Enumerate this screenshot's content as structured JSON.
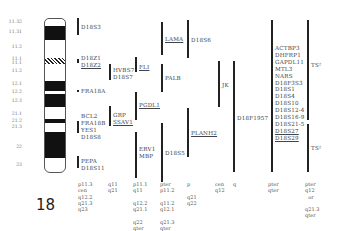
{
  "chromosome": {
    "number": "18",
    "band_labels": [
      {
        "text": "11.32",
        "y": 19
      },
      {
        "text": "11.31",
        "y": 29
      },
      {
        "text": "11.2",
        "y": 44
      },
      {
        "text": "11.1",
        "y": 56
      },
      {
        "text": "11.1",
        "y": 60
      },
      {
        "text": "11.2",
        "y": 68
      },
      {
        "text": "12.1",
        "y": 81
      },
      {
        "text": "12.2",
        "y": 89
      },
      {
        "text": "12.3",
        "y": 98
      },
      {
        "text": "21.1",
        "y": 111
      },
      {
        "text": "21.2",
        "y": 118
      },
      {
        "text": "21.3",
        "y": 124
      },
      {
        "text": "22",
        "y": 144
      },
      {
        "text": "23",
        "y": 162
      }
    ]
  },
  "columns": [
    {
      "id": "col1",
      "groups": [
        {
          "bar": [
            77,
            18,
            17
          ],
          "labels": [
            "D18S3"
          ],
          "underline": [
            false
          ],
          "label_x": 81,
          "label_y": 24
        },
        {
          "bar": [
            77,
            59,
            4
          ],
          "labels": [
            "D18Z1",
            "D18Z2"
          ],
          "underline": [
            false,
            true
          ],
          "label_x": 81,
          "label_y": 55
        },
        {
          "dot": [
            77,
            90
          ],
          "labels": [
            "FRA18A"
          ],
          "underline": [
            false
          ],
          "label_x": 81,
          "label_y": 88
        },
        {
          "bar": [
            77,
            121,
            12
          ],
          "labels": [
            "BCL2",
            "FRA18B",
            "YES1",
            "D18S8"
          ],
          "underline": [
            false,
            false,
            false,
            false
          ],
          "label_x": 81,
          "label_y": 113
        },
        {
          "bar": [
            77,
            156,
            12
          ],
          "labels": [
            "PEPA",
            "D18S11"
          ],
          "underline": [
            false,
            false
          ],
          "label_x": 81,
          "label_y": 158
        }
      ],
      "positions": {
        "x": 78,
        "y": 181,
        "lines": [
          "p11.3",
          "cen",
          "q12.2",
          "q21.3",
          "q23"
        ]
      }
    },
    {
      "id": "col2",
      "groups": [
        {
          "bar": [
            109,
            64,
            16
          ],
          "labels": [
            "HVBS7",
            "D18S7"
          ],
          "underline": [
            false,
            false
          ],
          "label_x": 113,
          "label_y": 67
        },
        {
          "bar": [
            109,
            106,
            20
          ],
          "labels": [
            "GRP",
            "SSAV1"
          ],
          "underline": [
            false,
            true
          ],
          "label_x": 113,
          "label_y": 112
        }
      ],
      "positions": {
        "x": 108,
        "y": 181,
        "lines": [
          "q11",
          "q21"
        ]
      }
    },
    {
      "id": "col3",
      "groups": [
        {
          "bar": [
            135,
            57,
            15
          ],
          "labels": [
            "FLI"
          ],
          "underline": [
            true
          ],
          "label_x": 139,
          "label_y": 64
        },
        {
          "bar": [
            135,
            92,
            28
          ],
          "labels": [
            "PGDL1"
          ],
          "underline": [
            true
          ],
          "label_x": 139,
          "label_y": 102
        },
        {
          "bar": [
            135,
            132,
            46
          ],
          "labels": [
            "ERV1",
            "MBP"
          ],
          "underline": [
            false,
            false
          ],
          "label_x": 139,
          "label_y": 146
        }
      ],
      "positions": {
        "x": 133,
        "y": 181,
        "lines": [
          "p11.1",
          "q11",
          "",
          "q12.2",
          "q21.1",
          "",
          "q22",
          "qter"
        ]
      }
    },
    {
      "id": "col4",
      "groups": [
        {
          "bar": [
            161,
            22,
            33
          ],
          "labels": [
            "LAMA"
          ],
          "underline": [
            true
          ],
          "label_x": 165,
          "label_y": 36
        },
        {
          "bar": [
            161,
            64,
            28
          ],
          "labels": [
            "PALB"
          ],
          "underline": [
            false
          ],
          "label_x": 165,
          "label_y": 75
        },
        {
          "bar": [
            161,
            123,
            59
          ],
          "labels": [
            "D18S5"
          ],
          "underline": [
            false
          ],
          "label_x": 165,
          "label_y": 150
        }
      ],
      "positions": {
        "x": 160,
        "y": 181,
        "lines": [
          "pter",
          "p11.2",
          "",
          "q11.2",
          "q12.1",
          "",
          "q21.3",
          "qter"
        ]
      }
    },
    {
      "id": "col5",
      "groups": [
        {
          "bar": [
            187,
            20,
            38
          ],
          "labels": [
            "D18S6"
          ],
          "underline": [
            false
          ],
          "label_x": 191,
          "label_y": 37
        },
        {
          "bar": [
            187,
            108,
            49
          ],
          "labels": [
            "PLANH2"
          ],
          "underline": [
            true
          ],
          "label_x": 191,
          "label_y": 130
        }
      ],
      "positions": {
        "x": 187,
        "y": 181,
        "lines": [
          "p",
          "",
          "q21",
          "q22"
        ]
      }
    },
    {
      "id": "col6",
      "groups": [
        {
          "bar": [
            218,
            61,
            46
          ],
          "labels": [
            "JK"
          ],
          "underline": [
            false
          ],
          "label_x": 222,
          "label_y": 82
        }
      ],
      "positions": {
        "x": 215,
        "y": 181,
        "lines": [
          "cen",
          "q12"
        ]
      }
    },
    {
      "id": "col7",
      "groups": [
        {
          "bar": [
            233,
            61,
            111
          ],
          "labels": [
            "D18F1957"
          ],
          "underline": [
            false
          ],
          "label_x": 237,
          "label_y": 115
        }
      ],
      "positions": {
        "x": 233,
        "y": 181,
        "lines": [
          "q"
        ]
      }
    },
    {
      "id": "col8",
      "groups": [
        {
          "bar": [
            271,
            20,
            152
          ],
          "labels": [
            "ACTBP3",
            "DHFRP1",
            "GAPDL11",
            "MTL3",
            "NARS",
            "D18F3S3",
            "D18S1",
            "D18S4",
            "D18S10",
            "D18S12-4",
            "D18S16-9",
            "D18S21-5",
            "D18S27",
            "D18S29"
          ],
          "underline": [
            false,
            false,
            false,
            false,
            false,
            false,
            false,
            false,
            false,
            false,
            false,
            false,
            true,
            true
          ],
          "label_x": 275,
          "label_y": 45
        }
      ],
      "positions": {
        "x": 268,
        "y": 181,
        "lines": [
          "pter",
          "qter"
        ]
      }
    },
    {
      "id": "col9",
      "groups": [
        {
          "bar": [
            307,
            20,
            100
          ],
          "labels": [
            "TS²"
          ],
          "underline": [
            false
          ],
          "label_x": 311,
          "label_y": 62
        },
        {
          "bar": [
            307,
            124,
            48
          ],
          "labels": [
            "TS²"
          ],
          "underline": [
            false
          ],
          "label_x": 311,
          "label_y": 145
        }
      ],
      "positions": {
        "x": 305,
        "y": 181,
        "lines": [
          "pter",
          "q12",
          "  or",
          "",
          "q21.3",
          "qter"
        ]
      }
    }
  ]
}
